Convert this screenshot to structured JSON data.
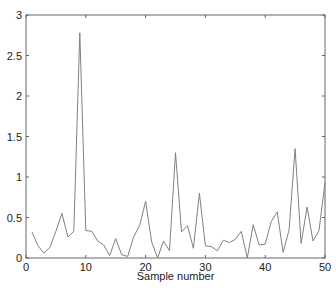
{
  "chart_data": {
    "type": "line",
    "title": "",
    "xlabel": "Sample number",
    "ylabel": "",
    "xlim": [
      0,
      50
    ],
    "ylim": [
      0,
      3
    ],
    "grid": false,
    "legend": null,
    "x_ticks": [
      "0",
      "10",
      "20",
      "30",
      "40",
      "50"
    ],
    "y_ticks": [
      "0",
      "0.5",
      "1",
      "1.5",
      "2",
      "2.5",
      "3"
    ],
    "x": [
      1,
      2,
      3,
      4,
      5,
      6,
      7,
      8,
      9,
      10,
      11,
      12,
      13,
      14,
      15,
      16,
      17,
      18,
      19,
      20,
      21,
      22,
      23,
      24,
      25,
      26,
      27,
      28,
      29,
      30,
      31,
      32,
      33,
      34,
      35,
      36,
      37,
      38,
      39,
      40,
      41,
      42,
      43,
      44,
      45,
      46,
      47,
      48,
      49,
      50
    ],
    "series": [
      {
        "name": "",
        "color": "#808080",
        "values": [
          0.32,
          0.15,
          0.06,
          0.13,
          0.33,
          0.55,
          0.26,
          0.33,
          2.78,
          0.34,
          0.33,
          0.21,
          0.16,
          0.03,
          0.24,
          0.04,
          0.02,
          0.26,
          0.4,
          0.7,
          0.2,
          0.0,
          0.21,
          0.09,
          1.3,
          0.32,
          0.4,
          0.12,
          0.8,
          0.15,
          0.14,
          0.09,
          0.22,
          0.19,
          0.23,
          0.33,
          0.0,
          0.41,
          0.16,
          0.17,
          0.45,
          0.57,
          0.07,
          0.35,
          1.35,
          0.18,
          0.63,
          0.21,
          0.34,
          0.93
        ]
      }
    ]
  }
}
